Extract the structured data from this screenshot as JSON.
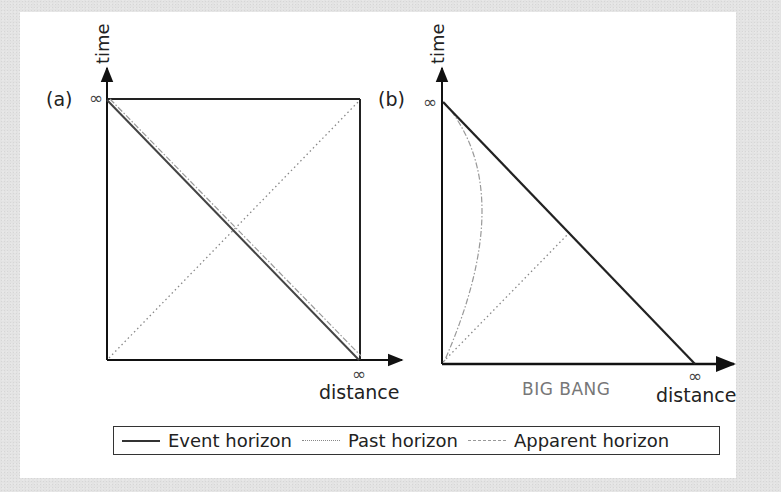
{
  "diagram": {
    "panels": [
      {
        "label": "(a)",
        "y_axis_label": "time",
        "x_axis_label": "distance",
        "y_infinity": "∞",
        "x_infinity": "∞",
        "bottom_label": ""
      },
      {
        "label": "(b)",
        "y_axis_label": "time",
        "x_axis_label": "distance",
        "y_infinity": "∞",
        "x_infinity": "∞",
        "bottom_label": "BIG BANG"
      }
    ],
    "legend": [
      {
        "label": "Event horizon",
        "style": "solid",
        "color": "#333333"
      },
      {
        "label": "Past horizon",
        "style": "dotted",
        "color": "#888888"
      },
      {
        "label": "Apparent horizon",
        "style": "dash-dot",
        "color": "#999999"
      }
    ],
    "colors": {
      "line": "#222222",
      "past_horizon": "#888888",
      "apparent_horizon": "#999999",
      "big_bang_text": "#777777",
      "background": "#ffffff"
    }
  }
}
